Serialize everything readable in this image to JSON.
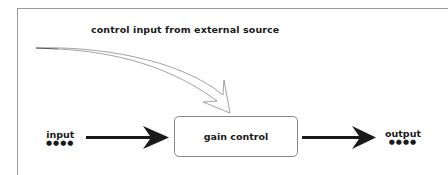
{
  "diagram": {
    "caption": "control input from external source",
    "block": {
      "label": "gain control"
    },
    "input": {
      "label": "input",
      "dots": "●●●●"
    },
    "output": {
      "label": "output",
      "dots": "●●●●"
    }
  },
  "colors": {
    "stroke": "#1a1a1a",
    "frame": "#9a9a9a",
    "box_border": "#8a8a8a",
    "curved_arrow_outline": "#8c8c8c"
  }
}
